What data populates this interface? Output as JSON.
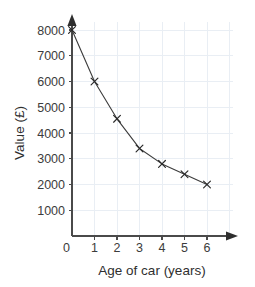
{
  "chart_data": {
    "type": "line",
    "title": "",
    "subtitle": "",
    "xlabel": "Age of car (years)",
    "ylabel": "Value (£)",
    "x": [
      0,
      1,
      2,
      3,
      4,
      5,
      6
    ],
    "values": [
      8000,
      6000,
      4550,
      3400,
      2800,
      2400,
      2000
    ],
    "series": [
      {
        "name": "Car value",
        "values": [
          8000,
          6000,
          4550,
          3400,
          2800,
          2400,
          2000
        ]
      }
    ],
    "xlim": [
      0,
      6
    ],
    "ylim": [
      0,
      8000
    ],
    "x_ticks": [
      0,
      1,
      2,
      3,
      4,
      5,
      6
    ],
    "x_tick_labels": [
      "0",
      "1",
      "2",
      "3",
      "4",
      "5",
      "6"
    ],
    "y_ticks": [
      0,
      1000,
      2000,
      3000,
      4000,
      5000,
      6000,
      7000,
      8000
    ],
    "y_tick_labels": [
      "0",
      "1000",
      "2000",
      "3000",
      "4000",
      "5000",
      "6000",
      "7000",
      "8000"
    ],
    "grid": true,
    "legend": false,
    "legend_position": "none",
    "marker": "x",
    "annotations": []
  },
  "colors": {
    "background": "#ffffff",
    "grid": "#e9eef4",
    "axis": "#4a4a4a",
    "line": "#3c3c3c",
    "marker": "#2b2b2b",
    "text": "#3c3c3c"
  },
  "axis_titles": {
    "x": "Age of car (years)",
    "y": "Value (£)"
  },
  "y_labels": {
    "t0": "0",
    "t1000": "1000",
    "t2000": "2000",
    "t3000": "3000",
    "t4000": "4000",
    "t5000": "5000",
    "t6000": "6000",
    "t7000": "7000",
    "t8000": "8000"
  },
  "x_labels": {
    "t0": "0",
    "t1": "1",
    "t2": "2",
    "t3": "3",
    "t4": "4",
    "t5": "5",
    "t6": "6"
  }
}
